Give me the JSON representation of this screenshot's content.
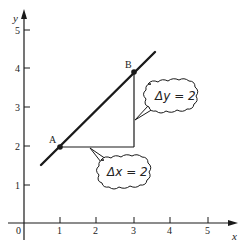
{
  "figure": {
    "type": "slope-diagram",
    "axes": {
      "x_label": "x",
      "y_label": "y",
      "origin_label": "0",
      "x_ticks": [
        "1",
        "2",
        "3",
        "4",
        "5"
      ],
      "y_ticks": [
        "1",
        "2",
        "3",
        "4",
        "5"
      ]
    },
    "points": [
      {
        "label": "A",
        "x": 1,
        "y": 2
      },
      {
        "label": "B",
        "x": 3,
        "y": 4
      }
    ],
    "line": {
      "from": [
        0.45,
        1.5
      ],
      "to": [
        3.55,
        4.5
      ]
    },
    "callouts": {
      "delta_y": "Δy = 2",
      "delta_x": "Δx = 2"
    },
    "colors": {
      "ink": "#1a1a1a",
      "background": "#ffffff"
    }
  }
}
